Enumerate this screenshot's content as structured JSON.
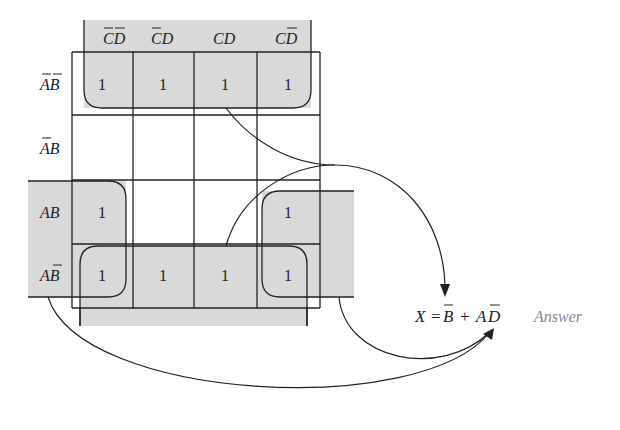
{
  "kmap": {
    "column_headers": [
      "C̅D̅",
      "C̅D",
      "CD",
      "CD̅"
    ],
    "row_headers": [
      "A̅B̅",
      "A̅B",
      "AB",
      "AB̅"
    ],
    "cells": [
      [
        "1",
        "1",
        "1",
        "1"
      ],
      [
        "",
        "",
        "",
        ""
      ],
      [
        "1",
        "",
        "",
        "1"
      ],
      [
        "1",
        "1",
        "1",
        "1"
      ]
    ],
    "groups": [
      {
        "term": "B̅",
        "cells": "rows A̅B̅ and AB̅ (all columns)"
      },
      {
        "term": "AD̅",
        "cells": "rows AB and AB̅, columns C̅D̅ and CD̅ (wraparound)"
      }
    ]
  },
  "result": {
    "lhs": "X",
    "equals": "=",
    "term1": "B",
    "plus": "+",
    "term2_a": "A",
    "term2_d": "D",
    "answer_label": "Answer"
  },
  "colors": {
    "shade": "#d9d9d9",
    "line": "#222222",
    "answer_text": "#888888"
  }
}
